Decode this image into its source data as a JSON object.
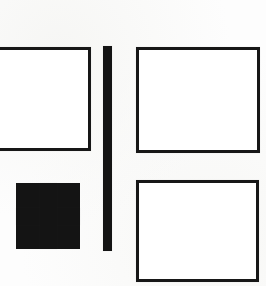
{
  "document": {
    "kind": "scanned-line-diagram",
    "title": "",
    "background_color": "#fdfdfd",
    "stroke_color": "#171717",
    "fill_color": "#ffffff",
    "width": 266,
    "height": 286
  },
  "shapes": {
    "left_rectangle": {
      "name": "left-rectangle",
      "label": "",
      "shape": "rectangle-outline",
      "x": -14,
      "y": 47,
      "width": 105,
      "height": 104,
      "stroke_width": 3,
      "clipped_edge": "left"
    },
    "plus_sign": {
      "name": "plus-sign",
      "label": "+",
      "shape": "plus",
      "x": 16,
      "y": 183,
      "width": 64,
      "height": 66,
      "arm_thickness": 17,
      "color": "#141414"
    },
    "divider_bar": {
      "name": "vertical-divider-bar",
      "label": "",
      "shape": "vertical-bar",
      "x": 103,
      "y": 46,
      "width": 9,
      "height": 205,
      "color": "#141414"
    },
    "top_right_rectangle": {
      "name": "top-right-rectangle",
      "label": "",
      "shape": "rectangle-outline",
      "x": 136,
      "y": 47,
      "width": 124,
      "height": 106,
      "stroke_width": 3
    },
    "bottom_right_rectangle": {
      "name": "bottom-right-rectangle",
      "label": "",
      "shape": "rectangle-outline",
      "x": 136,
      "y": 180,
      "width": 123,
      "height": 102,
      "stroke_width": 3
    }
  }
}
